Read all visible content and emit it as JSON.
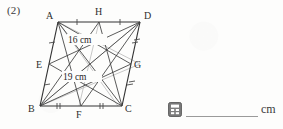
{
  "problem": {
    "number": "(2)"
  },
  "figure": {
    "vertices": [
      {
        "name": "A",
        "label": "A"
      },
      {
        "name": "D",
        "label": "D"
      },
      {
        "name": "B",
        "label": "B"
      },
      {
        "name": "C",
        "label": "C"
      },
      {
        "name": "E",
        "label": "E"
      },
      {
        "name": "H",
        "label": "H"
      },
      {
        "name": "G",
        "label": "G"
      },
      {
        "name": "F",
        "label": "F"
      }
    ],
    "measurements": [
      {
        "name": "upper-length",
        "label": "16 cm"
      },
      {
        "name": "lower-length",
        "label": "19 cm"
      }
    ]
  },
  "answer": {
    "icon": "calculator-icon",
    "value": "",
    "unit": "cm"
  }
}
